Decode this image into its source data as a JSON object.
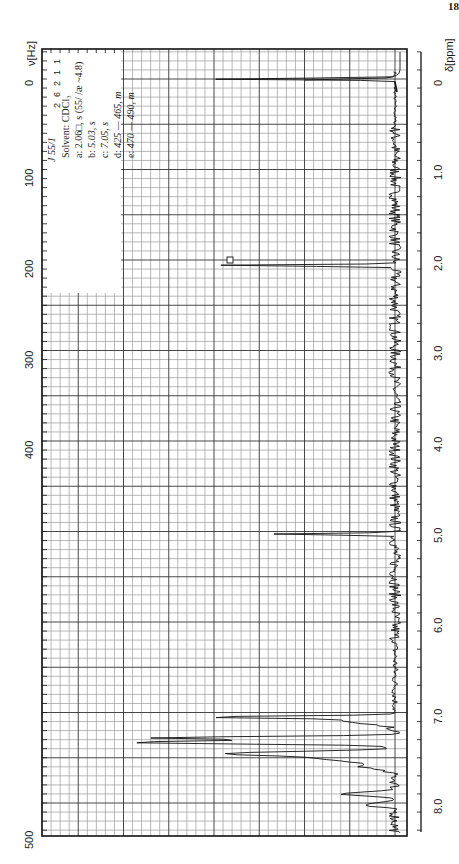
{
  "page": {
    "number": "18"
  },
  "sample": {
    "id": "J 55/1"
  },
  "legend": {
    "solvent": "Solvent: CDCl₃",
    "entries": [
      {
        "label": "a:",
        "text": "2.06□, s (55/ /æ ~4.8)"
      },
      {
        "label": "b:",
        "text": "5.03, s"
      },
      {
        "label": "c:",
        "text": "7.05, s"
      },
      {
        "label": "d:",
        "text": "425 — 465, m"
      },
      {
        "label": "e:",
        "text": "470 — 490, m"
      }
    ]
  },
  "integrals": [
    "1",
    "1",
    "2",
    "6",
    "2"
  ],
  "chart_data": {
    "type": "line",
    "orientation": "rotated 90deg (shift axis vertical, intensity horizontal)",
    "xlabel": "δ[ppm]",
    "x2label": "ν[Hz]",
    "ylabel": "intensity",
    "ppm_ticks": [
      "0",
      "1.0",
      "2.0",
      "3.0",
      "4.0",
      "5.0",
      "6.0",
      "7.0",
      "8.0"
    ],
    "hz_ticks": [
      "0",
      "100",
      "200",
      "300",
      "400",
      "500"
    ],
    "ppm_range": [
      -0.3,
      8.4
    ],
    "hz_range": [
      -30,
      500
    ],
    "grid": true,
    "peaks": [
      {
        "label": "TMS",
        "ppm": 0.0,
        "relative_height": 0.55
      },
      {
        "label": "a",
        "ppm": 2.06,
        "relative_height": 0.58,
        "multiplicity": "s"
      },
      {
        "label": "b",
        "ppm": 5.03,
        "relative_height": 0.37,
        "multiplicity": "s"
      },
      {
        "label": "c",
        "ppm": 7.05,
        "relative_height": 0.78,
        "multiplicity": "s"
      },
      {
        "label": "d",
        "ppm_range": [
          7.08,
          7.75
        ],
        "max_ppm": 7.35,
        "relative_height": 0.92,
        "multiplicity": "m"
      },
      {
        "label": "e",
        "ppm_range": [
          7.83,
          8.17
        ],
        "relative_height": 0.25,
        "multiplicity": "m"
      }
    ],
    "integral_ratios": [
      1,
      1,
      2,
      6,
      2
    ]
  }
}
